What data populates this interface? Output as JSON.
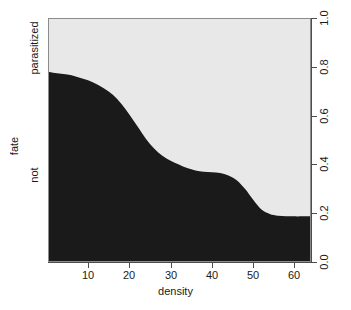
{
  "chart_data": {
    "type": "area",
    "plot_kind": "conditional-density-plot",
    "title": "",
    "xlabel": "density",
    "ylabel": "fate",
    "xlim": [
      0.3,
      64.0
    ],
    "ylim": [
      0.0,
      1.0
    ],
    "grid": false,
    "legend": "none",
    "x_ticks": [
      10,
      20,
      30,
      40,
      50,
      60
    ],
    "x_tick_labels": [
      "10",
      "20",
      "30",
      "40",
      "50",
      "60"
    ],
    "y_right_ticks": [
      0.0,
      0.2,
      0.4,
      0.6,
      0.8,
      1.0
    ],
    "y_right_tick_labels": [
      "0.0",
      "0.2",
      "0.4",
      "0.6",
      "0.8",
      "1.0"
    ],
    "y_left_category_labels": [
      "parasitized",
      "not"
    ],
    "categories": [
      "not",
      "parasitized"
    ],
    "colors": {
      "not": "#1a1a1a",
      "parasitized": "#e8e8e8",
      "axis": "#4d4d4d",
      "border": "#8c8c8c",
      "background": "#ffffff"
    },
    "series": [
      {
        "name": "not",
        "description": "lower dark band: conditional probability of fate = not",
        "x": [
          0.3,
          2,
          4,
          6,
          8,
          10,
          12,
          14,
          16,
          18,
          20,
          22,
          24,
          26,
          28,
          30,
          32,
          34,
          36,
          38,
          40,
          42,
          44,
          46,
          48,
          50,
          52,
          54,
          56,
          58,
          60,
          62,
          64
        ],
        "values": [
          0.78,
          0.775,
          0.77,
          0.765,
          0.755,
          0.745,
          0.73,
          0.71,
          0.685,
          0.65,
          0.605,
          0.555,
          0.505,
          0.465,
          0.435,
          0.415,
          0.4,
          0.385,
          0.375,
          0.37,
          0.368,
          0.365,
          0.355,
          0.335,
          0.3,
          0.255,
          0.215,
          0.197,
          0.19,
          0.188,
          0.187,
          0.187,
          0.187
        ]
      },
      {
        "name": "parasitized",
        "description": "upper light band: conditional probability of fate = parasitized (1 - not)",
        "x": [
          0.3,
          2,
          4,
          6,
          8,
          10,
          12,
          14,
          16,
          18,
          20,
          22,
          24,
          26,
          28,
          30,
          32,
          34,
          36,
          38,
          40,
          42,
          44,
          46,
          48,
          50,
          52,
          54,
          56,
          58,
          60,
          62,
          64
        ],
        "values": [
          0.22,
          0.225,
          0.23,
          0.235,
          0.245,
          0.255,
          0.27,
          0.29,
          0.315,
          0.35,
          0.395,
          0.445,
          0.495,
          0.535,
          0.565,
          0.585,
          0.6,
          0.615,
          0.625,
          0.63,
          0.632,
          0.635,
          0.645,
          0.665,
          0.7,
          0.745,
          0.785,
          0.803,
          0.81,
          0.812,
          0.813,
          0.813,
          0.813
        ]
      }
    ]
  },
  "axes": {
    "x_title": "density",
    "y_title": "fate",
    "x_ticks": [
      "10",
      "20",
      "30",
      "40",
      "50",
      "60"
    ],
    "y_right_ticks": [
      "0.0",
      "0.2",
      "0.4",
      "0.6",
      "0.8",
      "1.0"
    ],
    "y_left_labels": [
      "parasitized",
      "not"
    ]
  }
}
